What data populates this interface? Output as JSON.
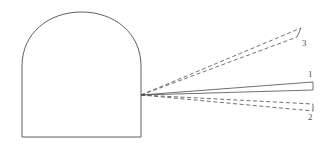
{
  "figure": {
    "title": "",
    "background_color": "#ffffff",
    "stroke_color": "#4d4d4d",
    "label_color": "#4d4d4d",
    "canvas": {
      "width": 333,
      "height": 155
    }
  },
  "tunnel": {
    "name": "arched tunnel cross-section",
    "left_wall_x": 22,
    "right_wall_x": 141,
    "floor_y": 137,
    "springline_y": 66,
    "crown_y": 12,
    "stroke_color": "#4d4d4d",
    "stroke_width": 0.9,
    "fill": "none"
  },
  "origin": {
    "x": 141,
    "y": 95,
    "note": "common apex of all three beams on the right wall"
  },
  "beams": [
    {
      "id": "beam-1",
      "label": "1",
      "style": "solid",
      "label_x": 308,
      "label_y": 70,
      "apex": {
        "x": 141,
        "y": 95
      },
      "upper_end": {
        "x": 313,
        "y": 82
      },
      "lower_end": {
        "x": 313,
        "y": 90
      },
      "end_cap": true
    },
    {
      "id": "beam-2",
      "label": "2",
      "style": "dashed",
      "label_x": 308,
      "label_y": 113,
      "apex": {
        "x": 141,
        "y": 95
      },
      "upper_end": {
        "x": 313,
        "y": 104
      },
      "lower_end": {
        "x": 313,
        "y": 111
      },
      "end_cap": true
    },
    {
      "id": "beam-3",
      "label": "3",
      "style": "dashed",
      "label_x": 302,
      "label_y": 39,
      "apex": {
        "x": 141,
        "y": 95
      },
      "upper_end": {
        "x": 301,
        "y": 28
      },
      "lower_end": {
        "x": 297,
        "y": 37
      },
      "end_cap": true
    }
  ],
  "labels": {
    "beam_1": "1",
    "beam_2": "2",
    "beam_3": "3"
  }
}
